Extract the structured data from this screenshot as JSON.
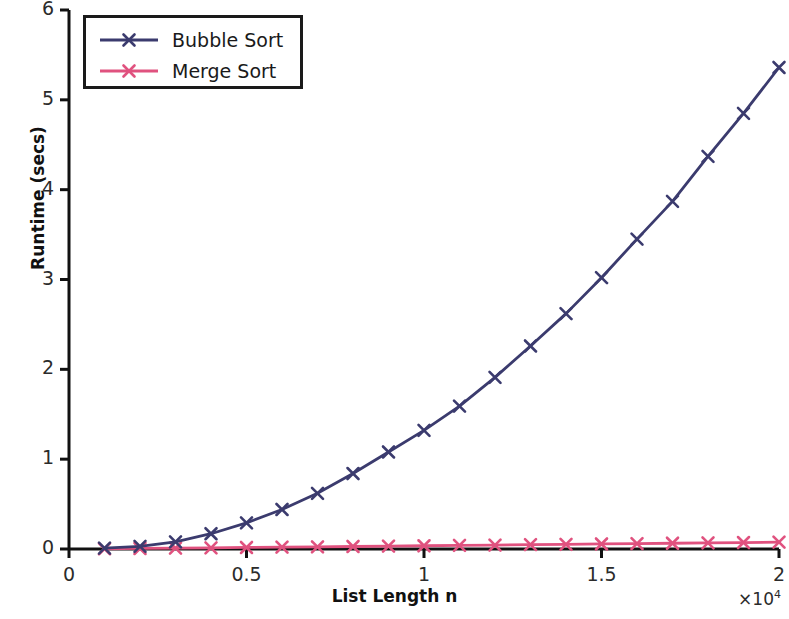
{
  "chart_data": {
    "type": "line",
    "title": "",
    "xlabel": "List Length n",
    "ylabel": "Runtime (secs)",
    "x_offset_text": "×10",
    "x_offset_exponent": "4",
    "xlim": [
      0,
      20000
    ],
    "ylim": [
      0,
      6
    ],
    "xticks": [
      0,
      5000,
      10000,
      15000,
      20000
    ],
    "xtick_labels": [
      "0",
      "0.5",
      "1",
      "1.5",
      "2"
    ],
    "yticks": [
      0,
      1,
      2,
      3,
      4,
      5,
      6
    ],
    "ytick_labels": [
      "0",
      "1",
      "2",
      "3",
      "4",
      "5",
      "6"
    ],
    "grid": false,
    "legend_position": "upper left",
    "marker": "x",
    "x": [
      1000,
      2000,
      3000,
      4000,
      5000,
      6000,
      7000,
      8000,
      9000,
      10000,
      11000,
      12000,
      13000,
      14000,
      15000,
      16000,
      17000,
      18000,
      19000,
      20000
    ],
    "series": [
      {
        "name": "Bubble Sort",
        "color": "#3b3b6e",
        "values": [
          0.01,
          0.03,
          0.08,
          0.17,
          0.29,
          0.44,
          0.62,
          0.84,
          1.08,
          1.32,
          1.59,
          1.91,
          2.26,
          2.62,
          3.02,
          3.45,
          3.87,
          4.37,
          4.85,
          5.36
        ]
      },
      {
        "name": "Merge Sort",
        "color": "#e0527f",
        "values": [
          0.003,
          0.006,
          0.01,
          0.013,
          0.017,
          0.021,
          0.024,
          0.028,
          0.032,
          0.036,
          0.04,
          0.044,
          0.048,
          0.052,
          0.056,
          0.06,
          0.064,
          0.068,
          0.072,
          0.076
        ]
      }
    ]
  },
  "legend": {
    "entries": [
      {
        "label": "Bubble Sort",
        "color": "#3b3b6e"
      },
      {
        "label": "Merge Sort",
        "color": "#e0527f"
      }
    ]
  },
  "axes": {
    "x_label": "List Length n",
    "y_label": "Runtime (secs)",
    "x_offset": "×10",
    "x_offset_exp": "4",
    "x_tick_labels": [
      "0",
      "0.5",
      "1",
      "1.5",
      "2"
    ],
    "y_tick_labels": [
      "0",
      "1",
      "2",
      "3",
      "4",
      "5",
      "6"
    ],
    "spine_color": "#111111"
  }
}
